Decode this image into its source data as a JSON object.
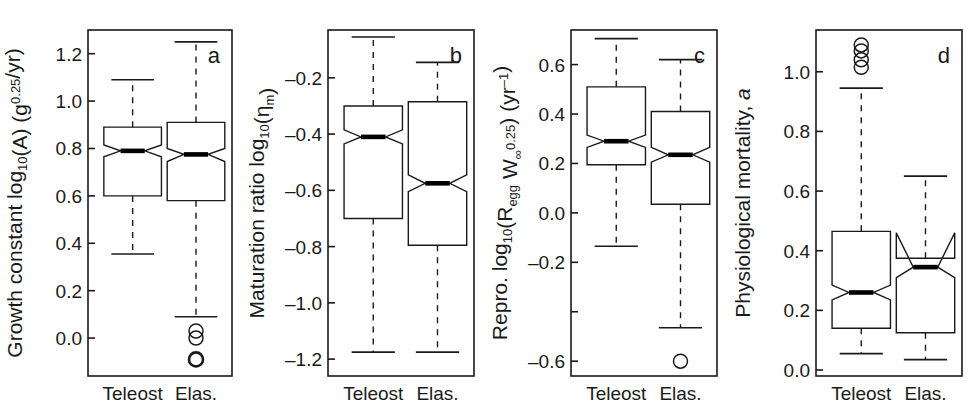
{
  "figure": {
    "categories": [
      "Teleost",
      "Elas."
    ],
    "line_color": "#1a1a1a",
    "median_color": "#000000",
    "background": "#ffffff"
  },
  "chart_data": [
    {
      "type": "box",
      "panel_letter": "a",
      "title": "",
      "ylabel": "Growth constant log10(A) (g^0.25/yr)",
      "ylabel_parts": {
        "lead": "Growth constant log",
        "sub1": "10",
        "mid": "(A) (g",
        "sup1": "0.25",
        "tail": "/yr)"
      },
      "xlabel": "",
      "ylim": [
        -0.16,
        1.3
      ],
      "yticks": [
        0.0,
        0.2,
        0.4,
        0.6,
        0.8,
        1.0,
        1.2
      ],
      "ytick_labels": [
        "0.0",
        "0.2",
        "0.4",
        "0.6",
        "0.8",
        "1.0",
        "1.2"
      ],
      "categories": [
        "Teleost",
        "Elas."
      ],
      "boxes": [
        {
          "name": "Teleost",
          "whisker_low": 0.355,
          "q1": 0.6,
          "median": 0.79,
          "q3": 0.89,
          "whisker_high": 1.09,
          "notch_low": 0.765,
          "notch_high": 0.815,
          "outliers": []
        },
        {
          "name": "Elas.",
          "whisker_low": 0.09,
          "q1": 0.58,
          "median": 0.775,
          "q3": 0.91,
          "whisker_high": 1.25,
          "notch_low": 0.745,
          "notch_high": 0.8,
          "outliers": [
            0.03,
            0.0,
            -0.09
          ]
        }
      ]
    },
    {
      "type": "box",
      "panel_letter": "b",
      "title": "",
      "ylabel": "Maturation ratio log10(etam)",
      "ylabel_parts": {
        "lead": "Maturation ratio log",
        "sub1": "10",
        "mid": "(η",
        "sub2": "m",
        "tail": ")"
      },
      "xlabel": "",
      "ylim": [
        -1.26,
        -0.03
      ],
      "yticks": [
        -0.2,
        -0.4,
        -0.6,
        -0.8,
        -1.0,
        -1.2
      ],
      "ytick_labels": [
        "–0.2",
        "–0.4",
        "–0.6",
        "–0.8",
        "–1.0",
        "–1.2"
      ],
      "categories": [
        "Teleost",
        "Elas."
      ],
      "boxes": [
        {
          "name": "Teleost",
          "whisker_low": -1.175,
          "q1": -0.7,
          "median": -0.41,
          "q3": -0.3,
          "whisker_high": -0.055,
          "notch_low": -0.435,
          "notch_high": -0.385,
          "outliers": []
        },
        {
          "name": "Elas.",
          "whisker_low": -1.175,
          "q1": -0.795,
          "median": -0.575,
          "q3": -0.285,
          "whisker_high": -0.145,
          "notch_low": -0.605,
          "notch_high": -0.545,
          "outliers": []
        }
      ]
    },
    {
      "type": "box",
      "panel_letter": "c",
      "title": "",
      "ylabel": "Repro. log10(Regg Winf^0.25) (yr^-1)",
      "ylabel_parts": {
        "lead": "Repro. log",
        "sub1": "10",
        "mid": "(R",
        "sub2": "egg",
        "mid2": " W",
        "sub3": "∞",
        "sup1": "0.25",
        "tail": ") (yr",
        "sup2": "–1",
        "tail2": ")"
      },
      "xlabel": "",
      "ylim": [
        -0.66,
        0.74
      ],
      "yticks": [
        0.6,
        0.4,
        0.2,
        0.0,
        -0.2,
        -0.6
      ],
      "ytick_labels": [
        "0.6",
        "0.4",
        "0.2",
        "0.0",
        "–0.2",
        "–0.6"
      ],
      "minor_yticks": [
        -0.4
      ],
      "categories": [
        "Teleost",
        "Elas."
      ],
      "boxes": [
        {
          "name": "Teleost",
          "whisker_low": -0.135,
          "q1": 0.195,
          "median": 0.29,
          "q3": 0.51,
          "whisker_high": 0.705,
          "notch_low": 0.265,
          "notch_high": 0.315,
          "outliers": []
        },
        {
          "name": "Elas.",
          "whisker_low": -0.465,
          "q1": 0.035,
          "median": 0.235,
          "q3": 0.41,
          "whisker_high": 0.62,
          "notch_low": 0.205,
          "notch_high": 0.265,
          "outliers": [
            -0.6
          ]
        }
      ]
    },
    {
      "type": "box",
      "panel_letter": "d",
      "title": "",
      "ylabel": "Physiological mortality, a",
      "ylabel_parts": {
        "lead": "Physiological mortality, ",
        "ital": "a"
      },
      "xlabel": "",
      "ylim": [
        -0.02,
        1.14
      ],
      "yticks": [
        0.0,
        0.2,
        0.4,
        0.6,
        0.8,
        1.0
      ],
      "ytick_labels": [
        "0.0",
        "0.2",
        "0.4",
        "0.6",
        "0.8",
        "1.0"
      ],
      "categories": [
        "Teleost",
        "Elas."
      ],
      "boxes": [
        {
          "name": "Teleost",
          "whisker_low": 0.055,
          "q1": 0.14,
          "median": 0.26,
          "q3": 0.465,
          "whisker_high": 0.945,
          "notch_low": 0.235,
          "notch_high": 0.285,
          "outliers": [
            1.09,
            1.07,
            1.04,
            1.015
          ]
        },
        {
          "name": "Elas.",
          "whisker_low": 0.035,
          "q1": 0.125,
          "median": 0.345,
          "q3": 0.375,
          "whisker_high": 0.65,
          "notch_low": 0.31,
          "notch_high": 0.46,
          "outliers": []
        }
      ]
    }
  ]
}
